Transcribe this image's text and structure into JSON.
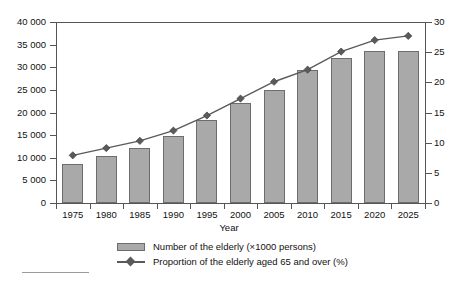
{
  "chart_data": {
    "type": "bar",
    "title": "",
    "xlabel": "Year",
    "ylabel": "",
    "categories": [
      "1975",
      "1980",
      "1985",
      "1990",
      "1995",
      "2000",
      "2005",
      "2010",
      "2015",
      "2020",
      "2025"
    ],
    "grid": false,
    "legend_position": "bottom",
    "left_axis": {
      "label": "Number of the elderly (×1000 persons)",
      "ylim": [
        0,
        40000
      ],
      "ticks": [
        0,
        5000,
        10000,
        15000,
        20000,
        25000,
        30000,
        35000,
        40000
      ],
      "tick_labels": [
        "0",
        "5 000",
        "10 000",
        "15 000",
        "20 000",
        "25 000",
        "30 000",
        "35 000",
        "40 000"
      ]
    },
    "right_axis": {
      "label": "Proportion of the elderly aged 65 and over (%)",
      "ylim": [
        0,
        30
      ],
      "ticks": [
        0,
        5,
        10,
        15,
        20,
        25,
        30
      ],
      "tick_labels": [
        "0",
        "5",
        "10",
        "15",
        "20",
        "25",
        "30"
      ]
    },
    "series": [
      {
        "name": "Number of the elderly (×1000 persons)",
        "type": "bar",
        "axis": "left",
        "color": "#a9a9a9",
        "edge_color": "#6d6d6d",
        "values": [
          8700,
          10500,
          12200,
          14900,
          18300,
          22000,
          25000,
          29500,
          32000,
          33600,
          33500
        ]
      },
      {
        "name": "Proportion of the elderly aged 65 and over (%)",
        "type": "line",
        "axis": "right",
        "color": "#5a5a5a",
        "marker": "diamond",
        "values": [
          7.9,
          9.1,
          10.3,
          12.0,
          14.5,
          17.3,
          20.1,
          22.1,
          25.1,
          27.0,
          27.7
        ]
      }
    ]
  },
  "legend": {
    "items": [
      {
        "marker": "bar-swatch",
        "label": "Number of the elderly (×1000 persons)"
      },
      {
        "marker": "line-diamond",
        "label": "Proportion of the elderly aged 65 and over (%)"
      }
    ]
  },
  "axis_title": {
    "x": "Year"
  }
}
